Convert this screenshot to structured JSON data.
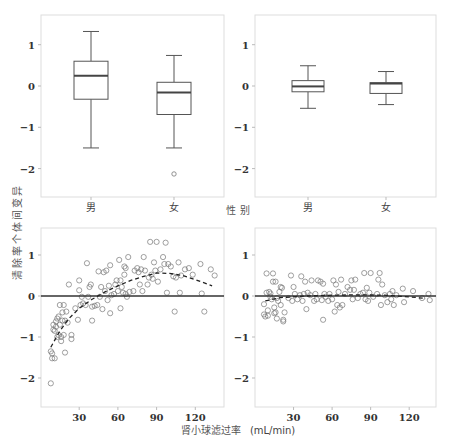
{
  "figure": {
    "y_label": "清除率个体间变异",
    "top_x_label": "性 别",
    "bottom_x_label_cn": "肾小球滤过率",
    "bottom_x_label_unit": "(mL/min)",
    "colors": {
      "frame": "#dddddd",
      "box": "#555555",
      "median": "#444444",
      "point": "#777777",
      "zero_line": "#333333",
      "trend": "#222222"
    }
  },
  "chart_data": [
    {
      "panel": "top-left",
      "type": "box",
      "xlabel": "性 别",
      "ylabel": "清除率个体间变异",
      "categories": [
        "男",
        "女"
      ],
      "ylim": [
        -2.7,
        1.7
      ],
      "yticks": [
        -2,
        -1,
        0,
        1
      ],
      "boxes": [
        {
          "category": "男",
          "whisker_low": -1.5,
          "q1": -0.32,
          "median": 0.25,
          "q3": 0.6,
          "whisker_high": 1.32,
          "outliers": []
        },
        {
          "category": "女",
          "whisker_low": -1.5,
          "q1": -0.69,
          "median": -0.16,
          "q3": 0.09,
          "whisker_high": 0.74,
          "outliers": [
            -2.13
          ]
        }
      ]
    },
    {
      "panel": "top-right",
      "type": "box",
      "xlabel": "性 别",
      "ylabel": "",
      "categories": [
        "男",
        "女"
      ],
      "ylim": [
        -2.7,
        1.7
      ],
      "yticks": [
        -2,
        -1,
        0,
        1
      ],
      "boxes": [
        {
          "category": "男",
          "whisker_low": -0.54,
          "q1": -0.14,
          "median": -0.01,
          "q3": 0.13,
          "whisker_high": 0.49,
          "outliers": []
        },
        {
          "category": "女",
          "whisker_low": -0.45,
          "q1": -0.18,
          "median": 0.06,
          "q3": 0.08,
          "whisker_high": 0.35,
          "outliers": []
        }
      ]
    },
    {
      "panel": "bottom-left",
      "type": "scatter",
      "xlabel": "肾小球滤过率 (mL/min)",
      "ylabel": "清除率个体间变异",
      "xlim": [
        0,
        142
      ],
      "ylim": [
        -2.7,
        1.7
      ],
      "xticks": [
        30,
        60,
        90,
        120
      ],
      "yticks": [
        -2,
        -1,
        0,
        1
      ],
      "reference_line_y": 0,
      "trend": {
        "style": "dashed",
        "x": [
          8,
          15,
          22,
          30,
          40,
          50,
          60,
          70,
          80,
          90,
          100,
          110,
          120,
          133
        ],
        "y": [
          -1.25,
          -0.85,
          -0.55,
          -0.3,
          -0.08,
          0.1,
          0.25,
          0.38,
          0.48,
          0.56,
          0.55,
          0.5,
          0.4,
          0.25
        ]
      },
      "points": [
        [
          8,
          -2.13
        ],
        [
          8,
          -1.35
        ],
        [
          9,
          -1.4
        ],
        [
          9,
          -1.52
        ],
        [
          10,
          -0.82
        ],
        [
          10,
          -0.7
        ],
        [
          11,
          -1.52
        ],
        [
          11,
          -0.85
        ],
        [
          12,
          -0.75
        ],
        [
          12,
          -0.62
        ],
        [
          13,
          -0.55
        ],
        [
          13,
          -1.0
        ],
        [
          14,
          -0.95
        ],
        [
          14,
          -0.5
        ],
        [
          15,
          -0.22
        ],
        [
          15,
          -0.7
        ],
        [
          16,
          -1.1
        ],
        [
          16,
          -1.0
        ],
        [
          17,
          -0.4
        ],
        [
          17,
          -0.6
        ],
        [
          18,
          -0.22
        ],
        [
          18,
          -0.95
        ],
        [
          19,
          -0.6
        ],
        [
          19,
          -1.38
        ],
        [
          20,
          -0.38
        ],
        [
          21,
          -0.65
        ],
        [
          22,
          0.28
        ],
        [
          24,
          -0.95
        ],
        [
          24,
          -1.05
        ],
        [
          27,
          -0.3
        ],
        [
          29,
          -0.58
        ],
        [
          30,
          0.38
        ],
        [
          30,
          0.14
        ],
        [
          31,
          -0.22
        ],
        [
          32,
          -0.02
        ],
        [
          33,
          -0.18
        ],
        [
          35,
          -0.22
        ],
        [
          36,
          0.8
        ],
        [
          37,
          -0.02
        ],
        [
          38,
          0.22
        ],
        [
          39,
          0.28
        ],
        [
          40,
          -0.26
        ],
        [
          40,
          -0.6
        ],
        [
          42,
          -0.24
        ],
        [
          44,
          -0.22
        ],
        [
          45,
          0.6
        ],
        [
          46,
          -0.02
        ],
        [
          47,
          0.22
        ],
        [
          48,
          -0.32
        ],
        [
          49,
          0.58
        ],
        [
          50,
          0.12
        ],
        [
          51,
          0.62
        ],
        [
          52,
          -0.1
        ],
        [
          53,
          0.25
        ],
        [
          54,
          -0.42
        ],
        [
          54,
          0.75
        ],
        [
          55,
          0.02
        ],
        [
          57,
          0.05
        ],
        [
          58,
          0.28
        ],
        [
          59,
          0.38
        ],
        [
          60,
          0.12
        ],
        [
          61,
          0.88
        ],
        [
          62,
          -0.3
        ],
        [
          62,
          0.38
        ],
        [
          63,
          0.22
        ],
        [
          64,
          0.08
        ],
        [
          65,
          0.72
        ],
        [
          65,
          0.52
        ],
        [
          66,
          0.68
        ],
        [
          66,
          0.05
        ],
        [
          67,
          -0.02
        ],
        [
          68,
          0.95
        ],
        [
          69,
          0.1
        ],
        [
          72,
          0.12
        ],
        [
          73,
          0.62
        ],
        [
          75,
          0.68
        ],
        [
          76,
          0.58
        ],
        [
          77,
          0.28
        ],
        [
          78,
          0.65
        ],
        [
          79,
          0.12
        ],
        [
          80,
          0.95
        ],
        [
          81,
          0.62
        ],
        [
          83,
          0.28
        ],
        [
          84,
          0.45
        ],
        [
          85,
          1.32
        ],
        [
          86,
          0.52
        ],
        [
          87,
          0.42
        ],
        [
          88,
          0.82
        ],
        [
          89,
          0.62
        ],
        [
          90,
          1.32
        ],
        [
          91,
          0.35
        ],
        [
          93,
          0.65
        ],
        [
          95,
          0.95
        ],
        [
          96,
          0.78
        ],
        [
          97,
          1.3
        ],
        [
          98,
          0.08
        ],
        [
          99,
          0.78
        ],
        [
          101,
          0.72
        ],
        [
          103,
          0.48
        ],
        [
          104,
          -0.38
        ],
        [
          105,
          0.45
        ],
        [
          107,
          0.82
        ],
        [
          108,
          0.08
        ],
        [
          109,
          0.5
        ],
        [
          112,
          0.65
        ],
        [
          115,
          0.68
        ],
        [
          118,
          0.52
        ],
        [
          124,
          0.78
        ],
        [
          125,
          0.06
        ],
        [
          127,
          -0.38
        ],
        [
          132,
          0.65
        ],
        [
          135,
          0.5
        ]
      ]
    },
    {
      "panel": "bottom-right",
      "type": "scatter",
      "xlabel": "肾小球滤过率 (mL/min)",
      "ylabel": "",
      "xlim": [
        0,
        142
      ],
      "ylim": [
        -2.7,
        1.7
      ],
      "xticks": [
        30,
        60,
        90,
        120
      ],
      "yticks": [
        -2,
        -1,
        0,
        1
      ],
      "reference_line_y": 0,
      "trend": {
        "style": "dashed",
        "x": [
          8,
          20,
          40,
          60,
          80,
          100,
          120,
          133
        ],
        "y": [
          -0.12,
          -0.04,
          0.0,
          0.02,
          0.03,
          0.02,
          -0.02,
          -0.06
        ]
      },
      "points": [
        [
          7,
          -0.45
        ],
        [
          7,
          -0.2
        ],
        [
          8,
          -0.5
        ],
        [
          9,
          0.55
        ],
        [
          9,
          0.08
        ],
        [
          10,
          -0.35
        ],
        [
          10,
          -0.48
        ],
        [
          11,
          0.1
        ],
        [
          12,
          -0.02
        ],
        [
          12,
          0.06
        ],
        [
          13,
          -0.08
        ],
        [
          14,
          0.55
        ],
        [
          14,
          0.35
        ],
        [
          15,
          -0.42
        ],
        [
          15,
          -0.28
        ],
        [
          16,
          0.35
        ],
        [
          16,
          -0.4
        ],
        [
          17,
          -0.05
        ],
        [
          17,
          -0.55
        ],
        [
          18,
          -0.12
        ],
        [
          19,
          0.1
        ],
        [
          20,
          0.22
        ],
        [
          20,
          -0.22
        ],
        [
          21,
          0.2
        ],
        [
          22,
          -0.58
        ],
        [
          22,
          -0.62
        ],
        [
          23,
          -0.4
        ],
        [
          26,
          -0.05
        ],
        [
          28,
          0.5
        ],
        [
          29,
          -0.12
        ],
        [
          30,
          0.22
        ],
        [
          31,
          0.05
        ],
        [
          33,
          -0.08
        ],
        [
          35,
          0.02
        ],
        [
          36,
          0.48
        ],
        [
          37,
          -0.12
        ],
        [
          38,
          0.05
        ],
        [
          39,
          0.35
        ],
        [
          40,
          -0.32
        ],
        [
          41,
          0.08
        ],
        [
          43,
          0.02
        ],
        [
          44,
          0.38
        ],
        [
          46,
          -0.12
        ],
        [
          47,
          0.05
        ],
        [
          48,
          -0.08
        ],
        [
          49,
          0.38
        ],
        [
          51,
          0.35
        ],
        [
          52,
          -0.1
        ],
        [
          53,
          0.3
        ],
        [
          53,
          -0.58
        ],
        [
          54,
          0.05
        ],
        [
          55,
          -0.02
        ],
        [
          57,
          -0.12
        ],
        [
          58,
          0.05
        ],
        [
          60,
          -0.08
        ],
        [
          61,
          0.38
        ],
        [
          62,
          -0.38
        ],
        [
          63,
          0.28
        ],
        [
          64,
          -0.22
        ],
        [
          65,
          0.1
        ],
        [
          66,
          -0.28
        ],
        [
          67,
          0.4
        ],
        [
          68,
          -0.22
        ],
        [
          70,
          0.05
        ],
        [
          72,
          0.22
        ],
        [
          74,
          0.15
        ],
        [
          75,
          0.38
        ],
        [
          76,
          -0.08
        ],
        [
          77,
          0.15
        ],
        [
          78,
          0.4
        ],
        [
          80,
          -0.05
        ],
        [
          82,
          0.05
        ],
        [
          84,
          0.08
        ],
        [
          85,
          0.56
        ],
        [
          86,
          -0.08
        ],
        [
          87,
          0.2
        ],
        [
          88,
          -0.12
        ],
        [
          89,
          0.08
        ],
        [
          90,
          0.56
        ],
        [
          92,
          -0.02
        ],
        [
          95,
          0.05
        ],
        [
          96,
          0.4
        ],
        [
          97,
          0.56
        ],
        [
          98,
          -0.22
        ],
        [
          99,
          0.28
        ],
        [
          101,
          0.02
        ],
        [
          103,
          -0.15
        ],
        [
          105,
          0.05
        ],
        [
          106,
          -0.08
        ],
        [
          107,
          0.12
        ],
        [
          108,
          -0.22
        ],
        [
          110,
          0.02
        ],
        [
          115,
          0.18
        ],
        [
          116,
          -0.15
        ],
        [
          123,
          0.12
        ],
        [
          130,
          -0.05
        ],
        [
          135,
          0.05
        ],
        [
          136,
          -0.1
        ]
      ]
    }
  ]
}
